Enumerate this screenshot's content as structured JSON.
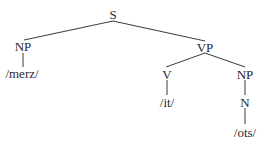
{
  "diagram": {
    "type": "syntax-tree",
    "nodes": {
      "s": {
        "label": "S"
      },
      "np_subject": {
        "label": "NP"
      },
      "merz": {
        "label": "/merz/"
      },
      "vp": {
        "label": "VP"
      },
      "v": {
        "label": "V"
      },
      "it": {
        "label": "/it/"
      },
      "np_object": {
        "label": "NP"
      },
      "n": {
        "label": "N"
      },
      "ots": {
        "label": "/ots/"
      }
    },
    "edges": [
      [
        "S",
        "NP"
      ],
      [
        "S",
        "VP"
      ],
      [
        "NP",
        "/merz/"
      ],
      [
        "VP",
        "V"
      ],
      [
        "VP",
        "NP"
      ],
      [
        "V",
        "/it/"
      ],
      [
        "NP",
        "N"
      ],
      [
        "N",
        "/ots/"
      ]
    ]
  }
}
